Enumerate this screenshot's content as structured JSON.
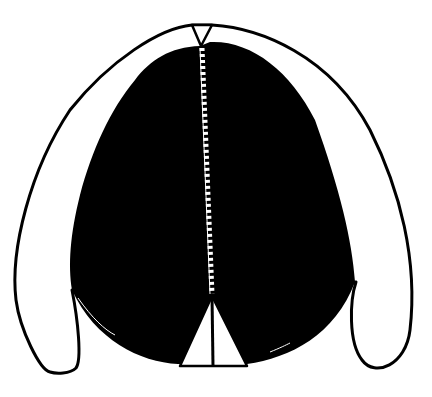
{
  "figure": {
    "colors": {
      "background": "#ffffff",
      "fill": "#000000",
      "outline": "#000000",
      "seam": "#ffffff"
    },
    "parts": [
      "outer-outline",
      "black-body",
      "top-notch",
      "center-seam",
      "bottom-triangle"
    ]
  }
}
